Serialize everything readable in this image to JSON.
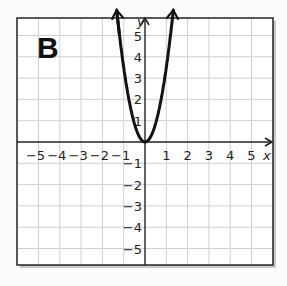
{
  "panel_label": "B",
  "chart_data": {
    "type": "line",
    "title": "",
    "panel": "B",
    "xlabel": "x",
    "ylabel": "y",
    "xlim": [
      -6,
      6
    ],
    "ylim": [
      -6,
      6
    ],
    "grid": true,
    "x_ticks": [
      "-5",
      "-4",
      "-3",
      "-2",
      "-1",
      "1",
      "2",
      "3",
      "4",
      "5"
    ],
    "y_ticks": [
      "5",
      "4",
      "3",
      "2",
      "1",
      "-1",
      "-2",
      "-3",
      "-4",
      "-5"
    ],
    "series": [
      {
        "name": "parabola",
        "description": "upward-opening parabola with vertex at origin, arrows at both ends",
        "vertex": [
          0,
          0
        ],
        "points": [
          [
            -1.35,
            5.8
          ],
          [
            -1,
            3.5
          ],
          [
            -0.5,
            0.9
          ],
          [
            0,
            0
          ],
          [
            0.5,
            0.9
          ],
          [
            1,
            3.5
          ],
          [
            1.35,
            5.8
          ]
        ]
      }
    ],
    "colors": {
      "curve": "#111111",
      "grid": "#cfcfcf",
      "axis": "#222222",
      "frame": "#222222"
    }
  }
}
